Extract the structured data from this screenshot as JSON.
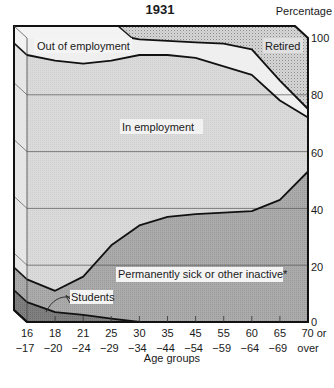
{
  "chart_data": {
    "type": "area",
    "stacked": true,
    "title": "1931",
    "ylabel": "Percentage",
    "xlabel": "Age groups",
    "ylim": [
      0,
      100
    ],
    "yticks": [
      0,
      20,
      40,
      60,
      80,
      100
    ],
    "grid": true,
    "style": "3d-extruded stacked area",
    "categories": [
      {
        "top": "16",
        "bottom": "−17"
      },
      {
        "top": "18",
        "bottom": "−20"
      },
      {
        "top": "21",
        "bottom": "−24"
      },
      {
        "top": "25",
        "bottom": "−29"
      },
      {
        "top": "30",
        "bottom": "−34"
      },
      {
        "top": "35",
        "bottom": "−44"
      },
      {
        "top": "45",
        "bottom": "−54"
      },
      {
        "top": "55",
        "bottom": "−59"
      },
      {
        "top": "60",
        "bottom": "−64"
      },
      {
        "top": "65",
        "bottom": "−69"
      },
      {
        "top": "70  or",
        "bottom": "over"
      }
    ],
    "category_labels": [
      "16-17",
      "18-20",
      "21-24",
      "25-29",
      "30-34",
      "35-44",
      "45-54",
      "55-59",
      "60-64",
      "65-69",
      "70 or over"
    ],
    "cumulative_boundaries": {
      "students_top": [
        7,
        3.5,
        2.5,
        1.2,
        0,
        0,
        0,
        0,
        0,
        0,
        0
      ],
      "permanently_sick_top": [
        15,
        11,
        16,
        27,
        34,
        37,
        38,
        38.5,
        39,
        43,
        53
      ],
      "in_employment_top": [
        94,
        92,
        91,
        92,
        94,
        94,
        93,
        90,
        87,
        78,
        72
      ],
      "out_of_employment_top": [
        100,
        100,
        100,
        100,
        99.5,
        99,
        98.5,
        98,
        96,
        85,
        75
      ],
      "retired_top": [
        100,
        100,
        100,
        100,
        100,
        100,
        100,
        100,
        100,
        100,
        100
      ]
    },
    "series": [
      {
        "name": "Students",
        "values": [
          7,
          3.5,
          2.5,
          1.2,
          0,
          0,
          0,
          0,
          0,
          0,
          0
        ],
        "color": "#7d7d7d"
      },
      {
        "name": "Permanently sick or other inactive*",
        "values": [
          8,
          7.5,
          13.5,
          25.8,
          34,
          37,
          38,
          38.5,
          39,
          43,
          53
        ],
        "color": "#a9a9a9"
      },
      {
        "name": "In employment",
        "values": [
          79,
          81,
          75,
          65,
          60,
          57,
          55,
          51.5,
          48,
          35,
          19
        ],
        "color": "#d9d9d9"
      },
      {
        "name": "Out of employment",
        "values": [
          6,
          8,
          9,
          8,
          5.5,
          5,
          5.5,
          8,
          9,
          7,
          3
        ],
        "color": "#efefef"
      },
      {
        "name": "Retired",
        "values": [
          0,
          0,
          0,
          0,
          0.5,
          1,
          1.5,
          2,
          4,
          15,
          25
        ],
        "color": "#cfcfcf"
      }
    ],
    "annotations": [
      "Out of employment",
      "Retired",
      "In employment",
      "Permanently sick or other inactive*",
      "Students"
    ]
  },
  "labels": {
    "title": "1931",
    "y_axis_title": "Percentage",
    "x_axis_title": "Age groups",
    "y_ticks": [
      "100",
      "80",
      "60",
      "40",
      "20",
      "0"
    ],
    "out_of_employment": "Out of employment",
    "retired": "Retired",
    "in_employment": "In employment",
    "permanently_sick": "Permanently sick or other inactive*",
    "students": "Students"
  }
}
